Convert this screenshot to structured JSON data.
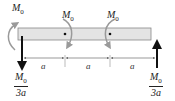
{
  "diagram": {
    "type": "beam-free-body",
    "beam": {
      "fill": "#e4e4e4",
      "stroke": "#888888"
    },
    "moments": [
      {
        "label": "M",
        "sub": "0",
        "position": "left-end"
      },
      {
        "label": "M",
        "sub": "0",
        "position": "point-1"
      },
      {
        "label": "M",
        "sub": "0",
        "position": "point-2"
      }
    ],
    "forces": {
      "left": {
        "num_main": "M",
        "num_sub": "0",
        "den": "3a",
        "direction": "down"
      },
      "right": {
        "num_main": "M",
        "num_sub": "0",
        "den": "3a",
        "direction": "up"
      }
    },
    "dimensions": [
      "a",
      "a",
      "a"
    ],
    "colors": {
      "arrow_gray": "#9a9a9a",
      "force_black": "#111111",
      "beam_fill": "#e4e4e4"
    }
  }
}
